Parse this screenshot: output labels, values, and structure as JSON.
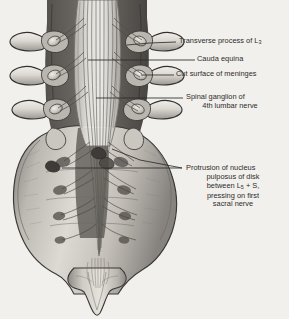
{
  "figure": {
    "background_color": "#f2f0ec",
    "ink_color": "#2b2b2b",
    "style": "grayscale medical line-and-wash illustration"
  },
  "labels": [
    {
      "id": "transverse-process",
      "lines": [
        "Transverse process of L",
        "3"
      ],
      "text_prefix": "Transverse process of L",
      "subscript": "3",
      "align": "left",
      "x": 179,
      "y": 38
    },
    {
      "id": "cauda-equina",
      "text": "Cauda equina",
      "align": "left",
      "x": 197,
      "y": 56
    },
    {
      "id": "cut-surface-meninges",
      "text": "Cut surface of meninges",
      "align": "left",
      "x": 176,
      "y": 71
    },
    {
      "id": "spinal-ganglion",
      "line1": "Spinal ganglion of",
      "line2": "4th lumbar nerve",
      "align": "center",
      "x": 186,
      "y": 93
    },
    {
      "id": "disk-protrusion",
      "line1": "Protrusion of nucleus",
      "line2": "pulposus of disk",
      "line3_prefix": "between L",
      "line3_sub": "5",
      "line3_suffix": " + S,",
      "line4": "pressing on first",
      "line5": "sacral nerve",
      "align": "center",
      "x": 186,
      "y": 164
    }
  ],
  "leader_lines": [
    {
      "id": "leader-transverse-process",
      "from": [
        128,
        45
      ],
      "to": [
        176,
        42
      ]
    },
    {
      "id": "leader-cauda-equina",
      "from": [
        88,
        60
      ],
      "to": [
        195,
        60
      ]
    },
    {
      "id": "leader-cut-surface",
      "from": [
        142,
        75
      ],
      "to": [
        174,
        75
      ]
    },
    {
      "id": "leader-spinal-ganglion",
      "from": [
        96,
        98
      ],
      "to": [
        183,
        98
      ]
    },
    {
      "id": "leader-disk-protrusion-upper",
      "from": [
        112,
        150
      ],
      "to": [
        182,
        168
      ]
    },
    {
      "id": "leader-disk-protrusion-lower",
      "from": [
        62,
        168
      ],
      "to": [
        182,
        168
      ]
    }
  ],
  "anatomy": {
    "vertebrae_count": 3,
    "parts": [
      "lumbar vertebral arches",
      "transverse processes",
      "spinal ganglia",
      "cauda equina nerve roots",
      "dural sac cut surface",
      "sacrum",
      "sacral foramina",
      "coccyx",
      "filum terminale"
    ]
  }
}
